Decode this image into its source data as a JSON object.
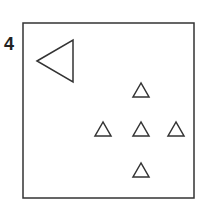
{
  "figure": {
    "number_label": "4",
    "stroke_color": "#333333",
    "frame": {
      "x": 23,
      "y": 23,
      "width": 171,
      "height": 175
    },
    "large_triangle": {
      "direction": "left",
      "points": "37,61 73,40 73,82"
    },
    "small_triangles": [
      {
        "id": "top",
        "points": "141,83 133,97 149,97"
      },
      {
        "id": "middle-left",
        "points": "103,122 95,136 111,136"
      },
      {
        "id": "middle-center",
        "points": "141,122 133,136 149,136"
      },
      {
        "id": "middle-right",
        "points": "176,122 168,136 184,136"
      },
      {
        "id": "bottom",
        "points": "141,163 133,177 149,177"
      }
    ]
  }
}
